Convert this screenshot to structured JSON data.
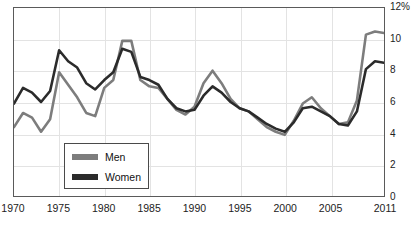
{
  "chart_data": {
    "type": "line",
    "title": "",
    "subtitle": "",
    "xlabel": "",
    "ylabel": "",
    "xlim": [
      1970,
      2011
    ],
    "ylim": [
      0,
      12
    ],
    "grid": true,
    "legend_position": "inside-bottom-left",
    "x": [
      1970,
      1971,
      1972,
      1973,
      1974,
      1975,
      1976,
      1977,
      1978,
      1979,
      1980,
      1981,
      1982,
      1983,
      1984,
      1985,
      1986,
      1987,
      1988,
      1989,
      1990,
      1991,
      1992,
      1993,
      1994,
      1995,
      1996,
      1997,
      1998,
      1999,
      2000,
      2001,
      2002,
      2003,
      2004,
      2005,
      2006,
      2007,
      2008,
      2009,
      2010,
      2011
    ],
    "series": [
      {
        "name": "Men",
        "color": "#7d7d7d",
        "values": [
          4.4,
          5.3,
          5.0,
          4.1,
          4.9,
          7.9,
          7.1,
          6.3,
          5.3,
          5.1,
          6.9,
          7.4,
          9.9,
          9.9,
          7.4,
          7.0,
          6.9,
          6.2,
          5.5,
          5.2,
          5.7,
          7.2,
          8.0,
          7.2,
          6.2,
          5.6,
          5.4,
          4.9,
          4.4,
          4.1,
          3.9,
          4.8,
          5.9,
          6.3,
          5.6,
          5.1,
          4.6,
          4.7,
          6.1,
          10.3,
          10.5,
          10.4
        ]
      },
      {
        "name": "Women",
        "color": "#2b2b2b",
        "values": [
          5.9,
          6.9,
          6.6,
          6.0,
          6.7,
          9.3,
          8.6,
          8.2,
          7.2,
          6.8,
          7.4,
          7.9,
          9.4,
          9.2,
          7.6,
          7.4,
          7.1,
          6.2,
          5.6,
          5.4,
          5.5,
          6.4,
          7.0,
          6.6,
          6.0,
          5.6,
          5.4,
          5.0,
          4.6,
          4.3,
          4.1,
          4.7,
          5.6,
          5.7,
          5.4,
          5.1,
          4.6,
          4.5,
          5.4,
          8.1,
          8.6,
          8.5
        ]
      }
    ],
    "yticks": [
      {
        "value": 12,
        "label": "12%"
      },
      {
        "value": 10,
        "label": "10"
      },
      {
        "value": 8,
        "label": "8"
      },
      {
        "value": 6,
        "label": "6"
      },
      {
        "value": 4,
        "label": "4"
      },
      {
        "value": 2,
        "label": "2"
      },
      {
        "value": 0,
        "label": "0"
      }
    ],
    "xticks": [
      {
        "value": 1970,
        "label": "1970"
      },
      {
        "value": 1975,
        "label": "1975"
      },
      {
        "value": 1980,
        "label": "1980"
      },
      {
        "value": 1985,
        "label": "1985"
      },
      {
        "value": 1990,
        "label": "1990"
      },
      {
        "value": 1995,
        "label": "1995"
      },
      {
        "value": 2000,
        "label": "2000"
      },
      {
        "value": 2005,
        "label": "2005"
      },
      {
        "value": 2011,
        "label": "2011"
      }
    ],
    "gridlines_x": [
      1975,
      1980,
      1985,
      1990,
      1995,
      2000,
      2005
    ],
    "gridlines_y": [
      2,
      4,
      6,
      8,
      10
    ]
  },
  "legend": {
    "items": [
      {
        "label": "Men",
        "color": "#7d7d7d"
      },
      {
        "label": "Women",
        "color": "#2b2b2b"
      }
    ]
  },
  "axis_colors": {
    "frame": "#5a5a5a",
    "grid": "#e3e3e3",
    "text": "#222222"
  }
}
